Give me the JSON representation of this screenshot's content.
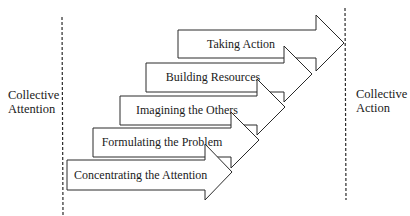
{
  "diagram": {
    "left_label": [
      "Collective",
      "Attention"
    ],
    "right_label": [
      "Collective",
      "Action"
    ],
    "steps": [
      {
        "label": "Concentrating the Attention",
        "order": 1
      },
      {
        "label": "Formulating the Problem",
        "order": 2
      },
      {
        "label": "Imagining the Others",
        "order": 3
      },
      {
        "label": "Building Resources",
        "order": 4
      },
      {
        "label": "Taking Action",
        "order": 5
      }
    ],
    "colors": {
      "stroke": "#2a2a2a",
      "fill": "#ffffff",
      "text": "#1a1a1a"
    }
  }
}
